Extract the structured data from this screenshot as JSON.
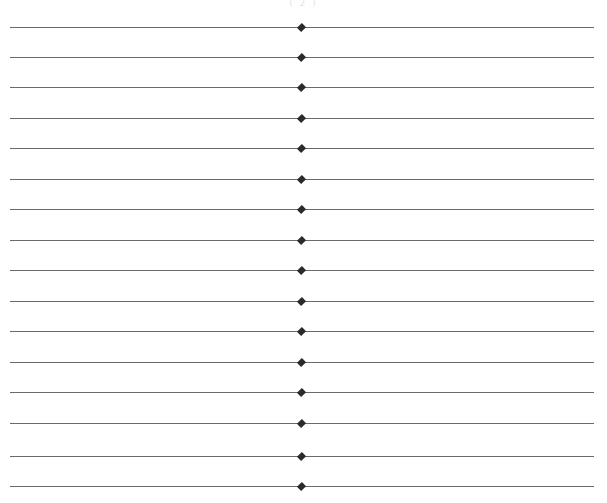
{
  "page": {
    "marker_text": "( 2 )",
    "line_color": "#6a6a6a",
    "diamond_color": "#2b2b2b",
    "line_count": 16,
    "lines": [
      {
        "y": 27
      },
      {
        "y": 57
      },
      {
        "y": 87
      },
      {
        "y": 118
      },
      {
        "y": 148
      },
      {
        "y": 179
      },
      {
        "y": 209
      },
      {
        "y": 240
      },
      {
        "y": 270
      },
      {
        "y": 301
      },
      {
        "y": 331
      },
      {
        "y": 362
      },
      {
        "y": 392
      },
      {
        "y": 423
      },
      {
        "y": 456
      },
      {
        "y": 486
      }
    ]
  }
}
